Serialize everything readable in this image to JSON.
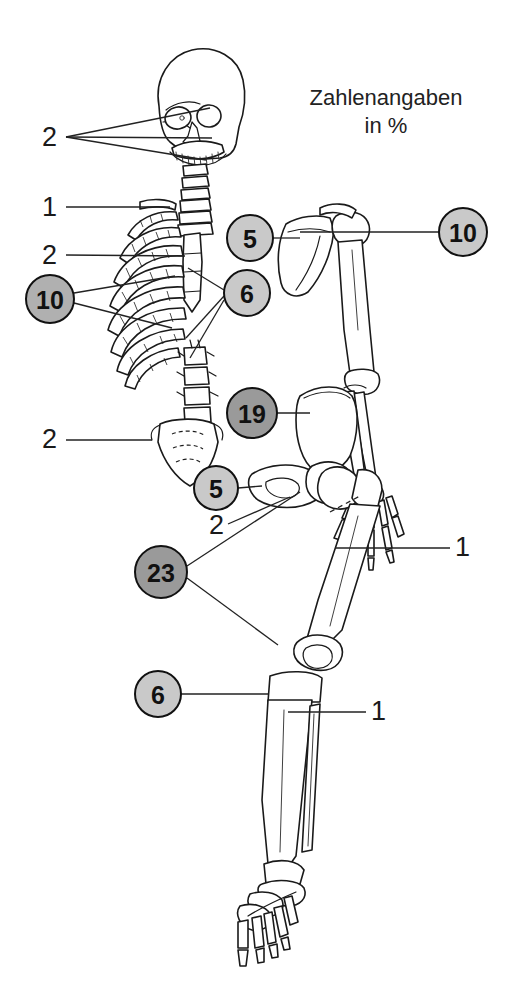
{
  "figure": {
    "kind": "anatomical-diagram",
    "title_line1": "Zahlenangaben",
    "title_line2": "in %",
    "colors": {
      "ink": "#1a1a1a",
      "bone_fill": "#ffffff",
      "badge_light": "#c9c9c9",
      "badge_mid": "#b0b0b0",
      "badge_dark": "#9a9a9a",
      "background": "#ffffff"
    }
  },
  "badges": [
    {
      "id": "badge-10-ribs",
      "value": "10",
      "cx": 50,
      "cy": 299,
      "r": 24,
      "tone": "mid",
      "font": 25
    },
    {
      "id": "badge-5-scapula",
      "value": "5",
      "cx": 250,
      "cy": 238,
      "r": 23,
      "tone": "light",
      "font": 25
    },
    {
      "id": "badge-6-spine",
      "value": "6",
      "cx": 247,
      "cy": 293,
      "r": 23,
      "tone": "light",
      "font": 25
    },
    {
      "id": "badge-10-humerus",
      "value": "10",
      "cx": 463,
      "cy": 232,
      "r": 24,
      "tone": "light",
      "font": 25
    },
    {
      "id": "badge-19-pelvis",
      "value": "19",
      "cx": 252,
      "cy": 413,
      "r": 25,
      "tone": "dark",
      "font": 25
    },
    {
      "id": "badge-5-hip",
      "value": "5",
      "cx": 216,
      "cy": 488,
      "r": 22,
      "tone": "light",
      "font": 25
    },
    {
      "id": "badge-23-femur",
      "value": "23",
      "cx": 161,
      "cy": 572,
      "r": 26,
      "tone": "dark",
      "font": 25
    },
    {
      "id": "badge-6-tibia",
      "value": "6",
      "cx": 158,
      "cy": 694,
      "r": 23,
      "tone": "light",
      "font": 25
    }
  ],
  "plain_labels": [
    {
      "id": "label-2-skull",
      "value": "2",
      "x": 42,
      "y": 124
    },
    {
      "id": "label-1-clavicle",
      "value": "1",
      "x": 42,
      "y": 194
    },
    {
      "id": "label-2-sternum",
      "value": "2",
      "x": 42,
      "y": 242
    },
    {
      "id": "label-2-sacrum",
      "value": "2",
      "x": 42,
      "y": 426
    },
    {
      "id": "label-2-femurneck",
      "value": "2",
      "x": 209,
      "y": 512
    },
    {
      "id": "label-1-hand",
      "value": "1",
      "x": 455,
      "y": 534
    },
    {
      "id": "label-1-fibula",
      "value": "1",
      "x": 371,
      "y": 698
    }
  ],
  "leader_lines": [
    {
      "id": "leader-skull-a",
      "from": [
        66,
        137
      ],
      "to": [
        210,
        108
      ]
    },
    {
      "id": "leader-skull-b",
      "from": [
        66,
        137
      ],
      "to": [
        212,
        138
      ]
    },
    {
      "id": "leader-skull-c",
      "from": [
        66,
        137
      ],
      "to": [
        206,
        160
      ]
    },
    {
      "id": "leader-clavicle",
      "from": [
        66,
        207
      ],
      "to": [
        170,
        207
      ]
    },
    {
      "id": "leader-sternum",
      "from": [
        66,
        255
      ],
      "to": [
        185,
        256
      ]
    },
    {
      "id": "leader-ribs-a",
      "from": [
        74,
        293
      ],
      "to": [
        175,
        276
      ]
    },
    {
      "id": "leader-ribs-b",
      "from": [
        74,
        303
      ],
      "to": [
        172,
        328
      ]
    },
    {
      "id": "leader-scapula",
      "from": [
        273,
        238
      ],
      "to": [
        300,
        238
      ]
    },
    {
      "id": "leader-humerus",
      "from": [
        439,
        232
      ],
      "to": [
        300,
        232
      ]
    },
    {
      "id": "leader-spine-a",
      "from": [
        224,
        290
      ],
      "to": [
        188,
        268
      ]
    },
    {
      "id": "leader-spine-b",
      "from": [
        224,
        296
      ],
      "to": [
        186,
        338
      ]
    },
    {
      "id": "leader-spine-c",
      "from": [
        224,
        300
      ],
      "to": [
        190,
        358
      ]
    },
    {
      "id": "leader-sacrum",
      "from": [
        66,
        440
      ],
      "to": [
        152,
        440
      ]
    },
    {
      "id": "leader-pelvis",
      "from": [
        277,
        413
      ],
      "to": [
        310,
        413
      ]
    },
    {
      "id": "leader-hip",
      "from": [
        238,
        488
      ],
      "to": [
        262,
        486
      ]
    },
    {
      "id": "leader-femurneck",
      "from": [
        228,
        524
      ],
      "to": [
        290,
        497
      ]
    },
    {
      "id": "leader-femur-a",
      "from": [
        187,
        566
      ],
      "to": [
        300,
        492
      ]
    },
    {
      "id": "leader-femur-b",
      "from": [
        187,
        578
      ],
      "to": [
        278,
        645
      ]
    },
    {
      "id": "leader-tibia",
      "from": [
        181,
        694
      ],
      "to": [
        268,
        694
      ]
    },
    {
      "id": "leader-fibula",
      "from": [
        366,
        712
      ],
      "to": [
        288,
        712
      ]
    },
    {
      "id": "leader-hand",
      "from": [
        450,
        548
      ],
      "to": [
        335,
        548
      ]
    }
  ],
  "leader_dashes": [
    {
      "id": "leader-dash-hand",
      "from": [
        330,
        512
      ],
      "to": [
        360,
        496
      ]
    }
  ],
  "chart_data": {
    "type": "bar",
    "title": "Zahlenangaben in %",
    "xlabel": "",
    "ylabel": "%",
    "categories": [
      "Rippen (links)",
      "Schulterblatt",
      "Wirbelsaeule",
      "Oberarm",
      "Becken",
      "Hueftgelenk",
      "Oberschenkel",
      "Schienbein",
      "Schaedel",
      "Schluesselbein",
      "Brustbein",
      "Kreuzbein",
      "Schenkelhals",
      "Hand",
      "Wadenbein"
    ],
    "values": [
      10,
      5,
      6,
      10,
      19,
      5,
      23,
      6,
      2,
      1,
      2,
      2,
      2,
      1,
      1
    ],
    "ylim": [
      0,
      25
    ]
  }
}
